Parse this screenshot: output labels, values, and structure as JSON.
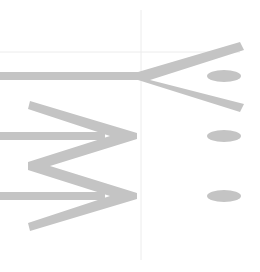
{
  "colors": {
    "background": "#ffffff",
    "shape": "#c4c4c4",
    "guide": "#ececec"
  },
  "guides": {
    "vertical": {
      "x": 141,
      "y1": 10,
      "y2": 260
    },
    "horizontal": {
      "y": 52,
      "x1": 0,
      "x2": 240
    }
  },
  "shafts": [
    {
      "id": "top",
      "y": 76,
      "x1": 0,
      "x2": 141,
      "thickness": 8
    },
    {
      "id": "middle",
      "y": 136,
      "x1": 0,
      "x2": 105,
      "thickness": 8
    },
    {
      "id": "bottom",
      "y": 196,
      "x1": 0,
      "x2": 105,
      "thickness": 8
    }
  ],
  "fork": {
    "points": [
      [
        240,
        42
      ],
      [
        244,
        50
      ],
      [
        150,
        80
      ],
      [
        244,
        104
      ],
      [
        240,
        112
      ],
      [
        138,
        80
      ],
      [
        138,
        72
      ]
    ]
  },
  "zigzag": {
    "points": [
      [
        30,
        101
      ],
      [
        137,
        133
      ],
      [
        137,
        139
      ],
      [
        50,
        166
      ],
      [
        137,
        193
      ],
      [
        137,
        199
      ],
      [
        30,
        231
      ],
      [
        28,
        223
      ],
      [
        110,
        196
      ],
      [
        28,
        170
      ],
      [
        28,
        162
      ],
      [
        110,
        136
      ],
      [
        28,
        109
      ]
    ]
  },
  "ellipses": [
    {
      "cx": 224,
      "cy": 76,
      "rx": 17,
      "ry": 6
    },
    {
      "cx": 224,
      "cy": 136,
      "rx": 17,
      "ry": 6
    },
    {
      "cx": 224,
      "cy": 196,
      "rx": 17,
      "ry": 6
    }
  ]
}
